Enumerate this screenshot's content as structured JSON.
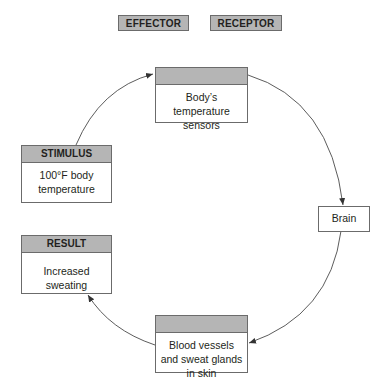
{
  "legend": {
    "effector": "EFFECTOR",
    "receptor": "RECEPTOR"
  },
  "nodes": {
    "receptor_box": {
      "header": "",
      "text": "Body’s temperature sensors"
    },
    "stimulus_box": {
      "header": "STIMULUS",
      "text": "100°F body temperature"
    },
    "brain_box": {
      "text": "Brain"
    },
    "result_box": {
      "header": "RESULT",
      "text": "Increased sweating"
    },
    "effector_box": {
      "header": "",
      "text": "Blood vessels and sweat glands in skin"
    }
  },
  "colors": {
    "header_fill": "#b5b5b5",
    "border": "#6b6b6b",
    "arrow": "#4a4a4a"
  },
  "arrows": [
    {
      "from": "stimulus_box",
      "to": "receptor_box"
    },
    {
      "from": "receptor_box",
      "to": "brain_box"
    },
    {
      "from": "brain_box",
      "to": "effector_box"
    },
    {
      "from": "effector_box",
      "to": "result_box"
    }
  ]
}
